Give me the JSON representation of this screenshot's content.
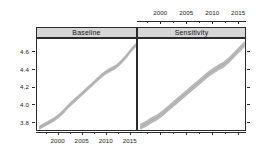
{
  "chart_data": {
    "type": "line",
    "title": "",
    "subtitle": "",
    "xlabel": "",
    "ylabel": "",
    "xlim": [
      1995.5,
      2016.5
    ],
    "ylim": [
      3.7,
      4.75
    ],
    "grid": false,
    "legend": null,
    "legend_position": "none",
    "style": "lattice-trellis-two-panel",
    "band_color": "#b9b9b9",
    "band_edge_color": "#a6a6a6",
    "strip_background": "#d6d6d6",
    "frame_color": "#2b2b2b",
    "x_ticks_top": [
      2000,
      2005,
      2010,
      2015
    ],
    "x_ticks_bottom": [
      2000,
      2005,
      2010,
      2015
    ],
    "x_tick_labels": [
      "2000",
      "2005",
      "2010",
      "2015"
    ],
    "y_ticks": [
      3.8,
      4.0,
      4.2,
      4.4,
      4.6
    ],
    "y_tick_labels": [
      "3.8",
      "4.0",
      "4.2",
      "4.4",
      "4.6"
    ],
    "x": [
      1996,
      1997,
      1998,
      1999,
      2000,
      2001,
      2002,
      2003,
      2004,
      2005,
      2006,
      2007,
      2008,
      2009,
      2010,
      2011,
      2012,
      2013,
      2014,
      2015,
      2016
    ],
    "panels": [
      {
        "name": "Baseline",
        "label": "Baseline",
        "series": [
          {
            "name": "fit",
            "values": [
              3.75,
              3.78,
              3.81,
              3.84,
              3.88,
              3.93,
              3.99,
              4.04,
              4.09,
              4.14,
              4.19,
              4.24,
              4.29,
              4.34,
              4.38,
              4.41,
              4.44,
              4.49,
              4.55,
              4.62,
              4.68
            ]
          },
          {
            "name": "lower",
            "values": [
              3.73,
              3.76,
              3.79,
              3.82,
              3.86,
              3.91,
              3.97,
              4.02,
              4.07,
              4.12,
              4.17,
              4.22,
              4.27,
              4.32,
              4.36,
              4.39,
              4.42,
              4.47,
              4.53,
              4.6,
              4.66
            ]
          },
          {
            "name": "upper",
            "values": [
              3.77,
              3.8,
              3.83,
              3.86,
              3.9,
              3.95,
              4.01,
              4.06,
              4.11,
              4.16,
              4.21,
              4.26,
              4.31,
              4.36,
              4.4,
              4.43,
              4.46,
              4.51,
              4.57,
              4.64,
              4.7
            ]
          }
        ]
      },
      {
        "name": "Sensitivity",
        "label": "Sensitivity",
        "series": [
          {
            "name": "fit",
            "values": [
              3.76,
              3.79,
              3.83,
              3.86,
              3.9,
              3.95,
              4.0,
              4.05,
              4.1,
              4.15,
              4.2,
              4.25,
              4.3,
              4.35,
              4.39,
              4.43,
              4.46,
              4.51,
              4.57,
              4.63,
              4.69
            ]
          },
          {
            "name": "lower",
            "values": [
              3.73,
              3.76,
              3.8,
              3.83,
              3.87,
              3.92,
              3.97,
              4.02,
              4.07,
              4.12,
              4.17,
              4.22,
              4.27,
              4.32,
              4.36,
              4.4,
              4.43,
              4.48,
              4.54,
              4.6,
              4.66
            ]
          },
          {
            "name": "upper",
            "values": [
              3.79,
              3.82,
              3.86,
              3.89,
              3.93,
              3.98,
              4.03,
              4.08,
              4.13,
              4.18,
              4.23,
              4.28,
              4.33,
              4.38,
              4.42,
              4.46,
              4.49,
              4.54,
              4.6,
              4.66,
              4.72
            ]
          }
        ]
      }
    ]
  }
}
